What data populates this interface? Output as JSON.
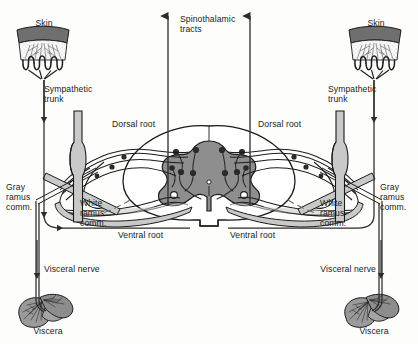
{
  "figure": {
    "type": "anatomical-diagram",
    "symmetry": "bilateral",
    "background_color": "#fdfdfc",
    "outline_color": "#1b1b1b",
    "gray_matter_color": "#8e8e8e",
    "white_matter_color": "#ffffff",
    "nerve_fill_color": "#c9c9c9",
    "skin_band_color": "#6f6f6f",
    "viscera_color": "#9a9a9a",
    "ganglion_color": "#2a2a2a"
  },
  "labels": {
    "skin_left": "Skin",
    "skin_right": "Skin",
    "spinothalamic": "Spinothalamic\ntracts",
    "sympathetic_trunk_left": "Sympathetic\ntrunk",
    "sympathetic_trunk_right": "Sympathetic\ntrunk",
    "dorsal_root_left": "Dorsal root",
    "dorsal_root_right": "Dorsal root",
    "gray_ramus_left": "Gray\nramus\ncomm.",
    "gray_ramus_right": "Gray\nramus\ncomm.",
    "white_ramus_left": "White\nramus\ncomm.",
    "white_ramus_right": "White\nramus\ncomm.",
    "ventral_root_left": "Ventral root",
    "ventral_root_right": "Ventral root",
    "visceral_nerve_left": "Visceral nerve",
    "visceral_nerve_right": "Visceral nerve",
    "viscera_left": "Viscera",
    "viscera_right": "Viscera"
  },
  "structures": [
    {
      "name": "skin",
      "count": 2,
      "description": "epidermal band with stippled dermis and looped free nerve endings"
    },
    {
      "name": "sympathetic-trunk-ganglion",
      "count": 2,
      "description": "vertical spindle-shaped paravertebral ganglion"
    },
    {
      "name": "dorsal-root-ganglion",
      "count": 2,
      "description": "cell bodies on dorsal root"
    },
    {
      "name": "spinal-cord",
      "count": 1,
      "description": "central butterfly-shaped gray matter within oval white matter"
    },
    {
      "name": "viscera",
      "count": 2,
      "description": "lobed visceral organ with branching innervation"
    },
    {
      "name": "spinothalamic-tract-arrow",
      "count": 2,
      "description": "ascending arrow to brain"
    },
    {
      "name": "visceral-nerve-arrow",
      "count": 2,
      "description": "afferent direction marker"
    },
    {
      "name": "cutaneous-nerve-arrow",
      "count": 2,
      "description": "afferent direction marker on skin axon"
    }
  ]
}
